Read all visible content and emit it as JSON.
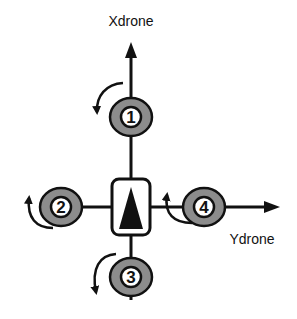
{
  "diagram": {
    "axes": {
      "x_label": "Xdrone",
      "y_label": "Ydrone"
    },
    "motors": [
      {
        "id": "1",
        "label": "1",
        "position": "front",
        "rotation": "counter-clockwise"
      },
      {
        "id": "2",
        "label": "2",
        "position": "left",
        "rotation": "clockwise"
      },
      {
        "id": "3",
        "label": "3",
        "position": "rear",
        "rotation": "counter-clockwise"
      },
      {
        "id": "4",
        "label": "4",
        "position": "right",
        "rotation": "clockwise"
      }
    ],
    "center": {
      "shape": "rounded-box-with-heading-triangle"
    },
    "colors": {
      "line": "#111111",
      "motor_ring": "#8c8c8c",
      "motor_inner": "#ffffff",
      "background": "#ffffff"
    }
  }
}
